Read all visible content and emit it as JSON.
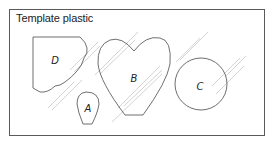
{
  "diagram": {
    "title": "Template plastic",
    "shapes": [
      {
        "id": "D",
        "label": "D",
        "type": "scalloped-rectangle"
      },
      {
        "id": "A",
        "label": "A",
        "type": "teardrop"
      },
      {
        "id": "B",
        "label": "B",
        "type": "heart"
      },
      {
        "id": "C",
        "label": "C",
        "type": "circle"
      }
    ],
    "colors": {
      "outline": "#4a4a4a",
      "hatch": "#c8c8c8",
      "frame": "#5a5a5a"
    }
  }
}
